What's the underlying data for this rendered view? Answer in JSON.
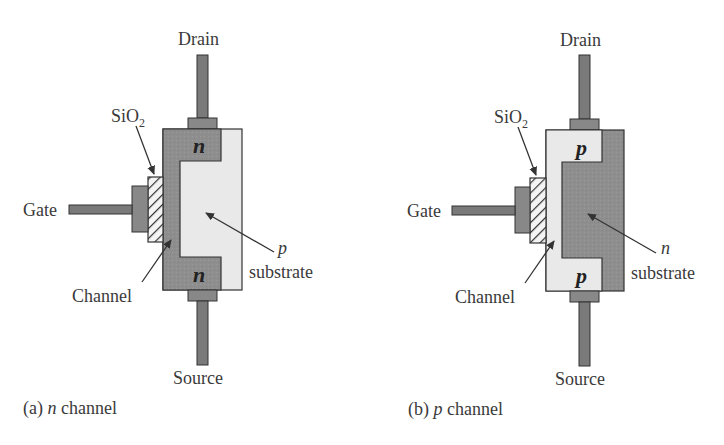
{
  "figure": {
    "colors": {
      "dark_region": "#8e8e8e",
      "light_region": "#e9e9e9",
      "outline": "#333333",
      "lead": "#7a7a7a",
      "pad": "#888888",
      "text": "#3a3a3a",
      "background": "#ffffff"
    },
    "panels": [
      {
        "id": "a",
        "caption_prefix": "(a)",
        "caption_type": "n",
        "caption_suffix": "channel",
        "terminals": {
          "drain": "Drain",
          "source": "Source",
          "gate": "Gate"
        },
        "oxide": {
          "label": "SiO",
          "subscript": "2"
        },
        "channel_label": "Channel",
        "source_drain_region": "n",
        "substrate_type": "p",
        "substrate_label": "substrate"
      },
      {
        "id": "b",
        "caption_prefix": "(b)",
        "caption_type": "p",
        "caption_suffix": "channel",
        "terminals": {
          "drain": "Drain",
          "source": "Source",
          "gate": "Gate"
        },
        "oxide": {
          "label": "SiO",
          "subscript": "2"
        },
        "channel_label": "Channel",
        "source_drain_region": "p",
        "substrate_type": "n",
        "substrate_label": "substrate"
      }
    ]
  }
}
